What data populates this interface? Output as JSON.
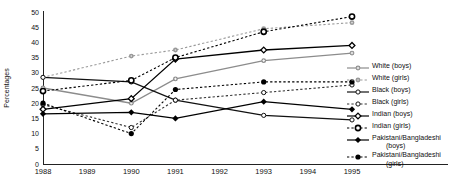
{
  "figure": {
    "background": "#ffffff",
    "axis_color": "#222222",
    "gray_series_color": "#8c8c8c",
    "black_series_color": "#000000"
  },
  "chart_data": {
    "type": "line",
    "title": "",
    "xlabel": "",
    "ylabel": "Percentages",
    "ylim": [
      0,
      50
    ],
    "yticks": [
      0,
      5,
      10,
      15,
      20,
      25,
      30,
      35,
      40,
      45,
      50
    ],
    "xticks": [
      1988,
      1989,
      1990,
      1991,
      1992,
      1993,
      1994,
      1995
    ],
    "x": [
      1988,
      1990,
      1991,
      1993,
      1995
    ],
    "grid": false,
    "legend_position": "right",
    "series": [
      {
        "name": "White (boys)",
        "label": "White",
        "suffix": "(boys)",
        "two_line": false,
        "line": "solid",
        "color": "#8c8c8c",
        "marker": "plus-gray",
        "values": [
          25,
          20,
          28,
          34,
          36.5
        ]
      },
      {
        "name": "White (girls)",
        "label": "White",
        "suffix": "(girls)",
        "two_line": false,
        "line": "dotted",
        "color": "#9a9a9a",
        "marker": "dot-gray",
        "values": [
          28.5,
          35.5,
          37.5,
          44.5,
          46.5
        ]
      },
      {
        "name": "Black (boys)",
        "label": "Black",
        "suffix": "(boys)",
        "two_line": false,
        "line": "solid",
        "color": "#111111",
        "marker": "open-circle",
        "values": [
          28.5,
          27,
          21,
          16,
          14.5
        ]
      },
      {
        "name": "Black (girls)",
        "label": "Black",
        "suffix": "(girls)",
        "two_line": false,
        "line": "dotted",
        "color": "#333333",
        "marker": "open-circle",
        "values": [
          19.5,
          12,
          21,
          23.5,
          26
        ]
      },
      {
        "name": "Indian (boys)",
        "label": "Indian",
        "suffix": "(boys)",
        "two_line": false,
        "line": "solid",
        "color": "#000000",
        "marker": "open-diamond",
        "values": [
          18,
          21.5,
          34.5,
          37.5,
          39
        ]
      },
      {
        "name": "Indian (girls)",
        "label": "Indian",
        "suffix": "(girls)",
        "two_line": false,
        "line": "dotted",
        "color": "#000000",
        "marker": "open-circle-bold",
        "values": [
          24,
          27.5,
          35,
          43.5,
          48.5
        ]
      },
      {
        "name": "Pakistani/Bangladeshi (boys)",
        "label": "Pakistani/Bangladeshi",
        "suffix": "(boys)",
        "two_line": true,
        "line": "solid",
        "color": "#000000",
        "marker": "filled-diamond",
        "values": [
          16.5,
          17,
          15,
          20.5,
          18
        ]
      },
      {
        "name": "Pakistani/Bangladeshi (girls)",
        "label": "Pakistani/Bangladeshi",
        "suffix": "(girls)",
        "two_line": true,
        "line": "dotted",
        "color": "#000000",
        "marker": "filled-circle",
        "values": [
          20,
          10,
          24.5,
          27,
          27
        ]
      }
    ]
  }
}
